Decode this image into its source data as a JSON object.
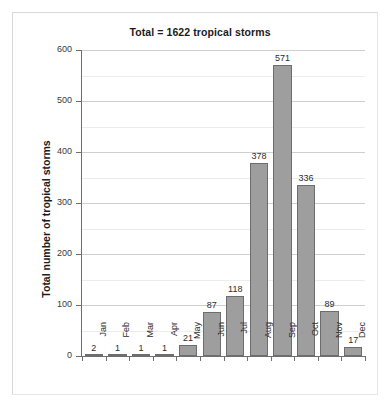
{
  "chart_data": {
    "type": "bar",
    "title": "Total = 1622 tropical storms",
    "xlabel": "",
    "ylabel": "Total number of tropical storms",
    "categories": [
      "Jan",
      "Feb",
      "Mar",
      "Apr",
      "May",
      "Jun",
      "Jul",
      "Aug",
      "Sep",
      "Oct",
      "Nov",
      "Dec"
    ],
    "values": [
      2,
      1,
      1,
      1,
      21,
      87,
      118,
      378,
      571,
      336,
      89,
      17
    ],
    "value_labels": [
      "2",
      "1",
      "1",
      "1",
      "21",
      "87",
      "118",
      "378",
      "571",
      "336",
      "89",
      "17"
    ],
    "ylim": [
      0,
      600
    ],
    "y_ticks": [
      0,
      100,
      200,
      300,
      400,
      500,
      600
    ],
    "y_tick_labels": [
      "0",
      "100",
      "200",
      "300",
      "400",
      "500",
      "600"
    ],
    "y_minor_ticks": [
      50,
      150,
      250,
      350,
      450,
      550
    ],
    "grid": true,
    "legend": false,
    "bar_color": "#9e9e9e",
    "bar_edge_color": "#6d6d6d",
    "gridline_color": "#cfcfcf",
    "minor_gridline_color": "#ececec",
    "axis_color": "#6f6f6f",
    "total": 1622
  }
}
